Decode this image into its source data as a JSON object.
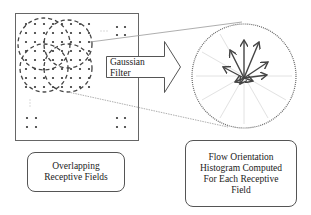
{
  "diagram": {
    "arrow_label": {
      "line1": "Gaussian",
      "line2": "Filter"
    },
    "left_caption": {
      "line1": "Overlapping",
      "line2": "Receptive Fields"
    },
    "right_caption": {
      "line1": "Flow Orientation",
      "line2": "Histogram Computed",
      "line3": "For Each Receptive",
      "line4": "Field"
    },
    "colors": {
      "stroke": "#555555",
      "dots": "#333333",
      "faint_rays": "#dddddd"
    }
  }
}
